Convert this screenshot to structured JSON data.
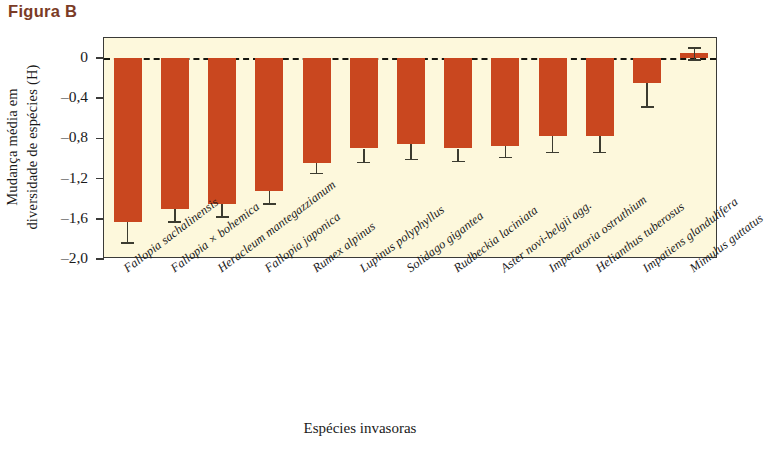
{
  "figure": {
    "label": "Figura B",
    "label_color": "#7b3b26"
  },
  "colors": {
    "bar": "#c9471f",
    "plot_background": "#fdf8dc",
    "axis": "#3a3a38",
    "error_bar": "#3c3c30",
    "zero_line": "#16160f"
  },
  "axis": {
    "y_title_line1": "Mudança média em",
    "y_title_line2": "diversidade de espécies (H)",
    "x_title": "Espécies invasoras",
    "y_ticks": [
      "0",
      "–0,4",
      "–0,8",
      "–1,2",
      "–1,6",
      "–2,0"
    ]
  },
  "chart_data": {
    "type": "bar",
    "title": "Figura B",
    "xlabel": "Espécies invasoras",
    "ylabel": "Mudança média em diversidade de espécies (H)",
    "ylim": [
      -2.0,
      0.2
    ],
    "yticks": [
      0,
      -0.4,
      -0.8,
      -1.2,
      -1.6,
      -2.0
    ],
    "grid": false,
    "legend": "none",
    "zero_reference_line": 0,
    "orientation": "vertical",
    "categories": [
      "Fallopia sachalinensis",
      "Fallopia × bohemica",
      "Heracleum mantegazzianum",
      "Fallopia japonica",
      "Rumex alpinus",
      "Lupinus polyphyllus",
      "Solidago gigantea",
      "Rudbeckia laciniata",
      "Aster novi-belgii agg.",
      "Imperatoria ostruthium",
      "Helianthus tuberosus",
      "Impatiens glandulifera",
      "Mimulus guttatus"
    ],
    "values": [
      -1.63,
      -1.5,
      -1.45,
      -1.32,
      -1.04,
      -0.9,
      -0.86,
      -0.9,
      -0.88,
      -0.78,
      -0.78,
      -0.25,
      0.05
    ],
    "error_low": [
      -1.83,
      -1.62,
      -1.57,
      -1.44,
      -1.14,
      -1.03,
      -1.0,
      -1.02,
      -0.98,
      -0.93,
      -0.93,
      -0.48,
      -0.01
    ],
    "error_high": [
      -1.63,
      -1.5,
      -1.45,
      -1.32,
      -1.04,
      -0.9,
      -0.86,
      -0.9,
      -0.88,
      -0.78,
      -0.78,
      -0.25,
      0.11
    ]
  }
}
